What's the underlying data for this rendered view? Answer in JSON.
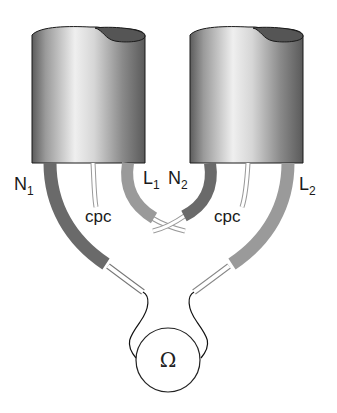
{
  "figure": {
    "cables": [
      {
        "id": "left-cable"
      },
      {
        "id": "right-cable"
      }
    ],
    "labels": {
      "n1": "N",
      "n1_sub": "1",
      "l1": "L",
      "l1_sub": "1",
      "n2": "N",
      "n2_sub": "2",
      "l2": "L",
      "l2_sub": "2",
      "cpc_left": "cpc",
      "cpc_right": "cpc",
      "meter_symbol": "Ω"
    },
    "colors": {
      "neutral_conductor": "#6e6e6e",
      "line_conductor": "#9a9a9a",
      "cpc_sleeve": "#ffffff",
      "cable_dark": "#5a5a5a",
      "cable_light": "#e8e8e8",
      "lead_wire": "#111111"
    }
  }
}
